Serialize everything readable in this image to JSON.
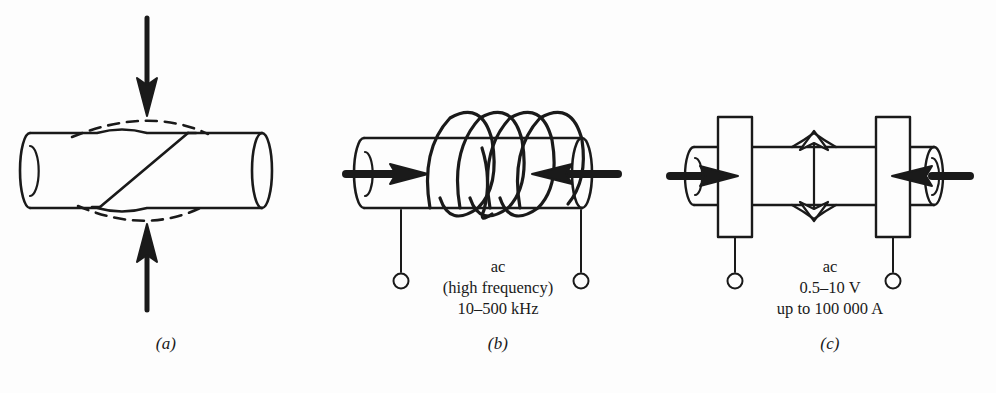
{
  "figure": {
    "background_color": "#fdfdfd",
    "ink_color": "#1a1a1a",
    "panels": [
      {
        "id": "a",
        "caption": "(a)",
        "process": "friction-welding",
        "annotation_lines": []
      },
      {
        "id": "b",
        "caption": "(b)",
        "process": "high-frequency-induction-welding",
        "annotation_lines": [
          "ac",
          "(high frequency)",
          "10–500 kHz"
        ]
      },
      {
        "id": "c",
        "caption": "(c)",
        "process": "resistance-flash-welding",
        "annotation_lines": [
          "ac",
          "0.5–10 V",
          "up to 100 000 A"
        ]
      }
    ]
  },
  "panel_a": {
    "caption": "(a)",
    "annot": {
      "l1": "",
      "l2": "",
      "l3": ""
    }
  },
  "panel_b": {
    "caption": "(b)",
    "annot": {
      "l1": "ac",
      "l2": "(high frequency)",
      "l3": "10–500 kHz"
    }
  },
  "panel_c": {
    "caption": "(c)",
    "annot": {
      "l1": "ac",
      "l2": "0.5–10 V",
      "l3": "up to 100 000 A"
    }
  },
  "icons": {
    "down_arrow": "arrow-down",
    "up_arrow": "arrow-up",
    "right_arrow": "arrow-right",
    "left_arrow": "arrow-left",
    "double_arrow": "arrow-double-vertical",
    "terminal": "terminal-circle"
  }
}
